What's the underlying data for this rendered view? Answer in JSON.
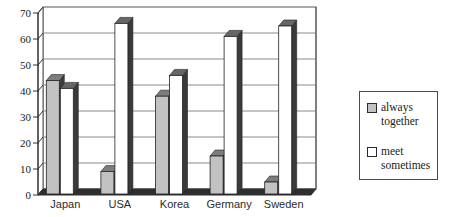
{
  "chart_data": {
    "type": "bar",
    "style": "3d-clustered",
    "title": "",
    "xlabel": "",
    "ylabel": "",
    "categories": [
      "Japan",
      "USA",
      "Korea",
      "Germany",
      "Sweden"
    ],
    "series": [
      {
        "name": "always together",
        "values": [
          44,
          9,
          38,
          15,
          5
        ],
        "front_color": "#c2c2c2",
        "top_color": "#7d7d7d",
        "side_color": "#3e3e3e"
      },
      {
        "name": "meet sometimes",
        "values": [
          41,
          66,
          46,
          61,
          65
        ],
        "front_color": "#ffffff",
        "top_color": "#666666",
        "side_color": "#3a3a3a"
      }
    ],
    "ylim": [
      0,
      70
    ],
    "yticks": [
      0,
      10,
      20,
      30,
      40,
      50,
      60,
      70
    ],
    "grid": true,
    "legend_position": "right",
    "gridline_color": "#8a8a8a",
    "wall_border_color": "#555555",
    "floor_color": "#2e2e2e",
    "axis_line_color": "#333333",
    "axis_text_color": "#1a1a1a"
  }
}
